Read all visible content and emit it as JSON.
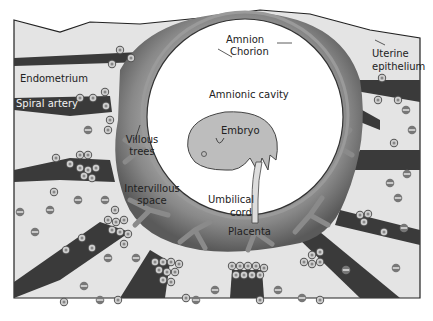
{
  "figure": {
    "labels": {
      "amnion": "Amnion",
      "chorion": "Chorion",
      "uterine_epithelium_1": "Uterine",
      "uterine_epithelium_2": "epithelium",
      "endometrium": "Endometrium",
      "spiral_artery": "Spiral artery",
      "amnionic_cavity": "Amnionic cavity",
      "embryo": "Embryo",
      "villous_trees_1": "Villous",
      "villous_trees_2": "trees",
      "intervillous_space_1": "Intervillous",
      "intervillous_space_2": "space",
      "umbilical_cord_1": "Umbilical",
      "umbilical_cord_2": "cord",
      "placenta": "Placenta"
    },
    "colors": {
      "background": "#ffffff",
      "endometrium": "#e4e4e4",
      "vessel": "#3a3a3a",
      "placenta_outer": "#5e5e5e",
      "placenta_inner": "#a8a8a8",
      "villi": "#8a8a8a",
      "cavity": "#ffffff",
      "embryo": "#bdbdbd",
      "outline": "#222222"
    }
  }
}
